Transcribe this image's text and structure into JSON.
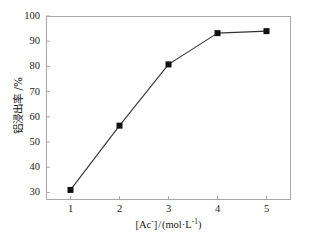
{
  "chart_data": {
    "type": "line",
    "title": "",
    "subtitle": "",
    "xlabel": "[Ac⁻]/(mol·L⁻¹)",
    "ylabel": "铝浸出率 /%",
    "x": [
      1,
      2,
      3,
      4,
      5
    ],
    "values": [
      31,
      56.5,
      80.8,
      93.2,
      94
    ],
    "series": [
      {
        "name": "铝浸出率",
        "x": [
          1,
          2,
          3,
          4,
          5
        ],
        "values": [
          31,
          56.5,
          80.8,
          93.2,
          94
        ]
      }
    ],
    "xlim": [
      0.5,
      5.5
    ],
    "ylim": [
      27,
      100
    ],
    "xticks": [
      1,
      2,
      3,
      4,
      5
    ],
    "yticks": [
      30,
      40,
      50,
      60,
      70,
      80,
      90,
      100
    ],
    "xtick_labels": [
      "1",
      "2",
      "3",
      "4",
      "5"
    ],
    "ytick_labels": [
      "30",
      "40",
      "50",
      "60",
      "70",
      "80",
      "90",
      "100"
    ],
    "grid": false,
    "legend": false,
    "legend_position": "none",
    "marker": "filled-square",
    "marker_color": "#111111",
    "line_color": "#333333",
    "frame_color": "#a8a8a8",
    "background": "#ffffff"
  },
  "axis": {
    "x_title_parts": {
      "bracket_open": "[Ac",
      "charge": "-",
      "bracket_close": "]",
      "slash": "/",
      "unit_open": "(mol",
      "dot": "·",
      "unit_l": "L",
      "unit_exp": "-1",
      "unit_close": ")"
    },
    "y_title": "铝浸出率 /%"
  }
}
